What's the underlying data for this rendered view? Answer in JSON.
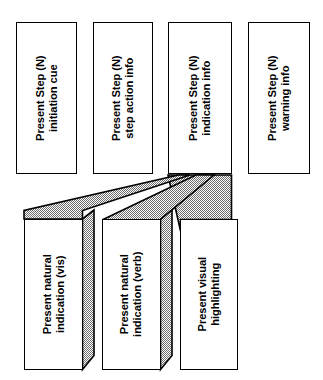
{
  "diagram": {
    "type": "hierarchical-task-decomposition",
    "orientation": "rotated-90-ccw",
    "colors": {
      "background": "#ffffff",
      "box_fill": "#ffffff",
      "stroke": "#000000",
      "connector_fill": "#b3b3b3",
      "connector_stroke": "#000000"
    },
    "parent_nodes": [
      {
        "id": "present-step-initiation-cue",
        "line1": "Present Step (N)",
        "line2": "initiation cue"
      },
      {
        "id": "present-step-action-info",
        "line1": "Present Step (N)",
        "line2": "step action info"
      },
      {
        "id": "present-step-indication-info",
        "line1": "Present Step (N)",
        "line2": "indication info"
      },
      {
        "id": "present-step-warning-info",
        "line1": "Present Step (N)",
        "line2": "warning info"
      }
    ],
    "child_nodes": [
      {
        "id": "present-natural-indication-vis",
        "line1": "Present natural",
        "line2": "indication (vis)"
      },
      {
        "id": "present-natural-indication-verb",
        "line1": "Present natural",
        "line2": "indication (verb)"
      },
      {
        "id": "present-visual-highlighting",
        "line1": "Present visual",
        "line2": "highlighting"
      }
    ],
    "connector": {
      "name": "fan-connector",
      "parent_source": "present-step-indication-info",
      "child_targets": [
        "present-natural-indication-vis",
        "present-natural-indication-verb",
        "present-visual-highlighting"
      ]
    }
  }
}
